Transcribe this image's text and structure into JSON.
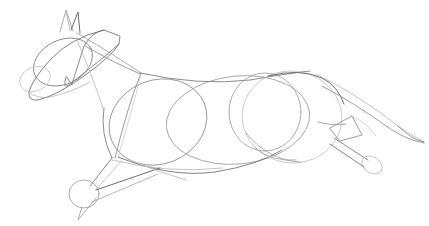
{
  "artwork": {
    "title": "Horse construction sketch",
    "subject": "galloping horse",
    "medium": "graphite pencil on white paper",
    "style": "gesture / construction under-drawing",
    "orientation": "facing left",
    "background_color": "#ffffff",
    "canvas": {
      "width": 429,
      "height": 226
    }
  },
  "palette": {
    "paper": "#ffffff",
    "graphite_dark": "#6b6b73",
    "graphite_mid": "#8a8a92",
    "graphite_light": "#a9a9b1",
    "graphite_faint": "#c2c2c8"
  },
  "line_weights": {
    "primary": 1.0,
    "secondary": 0.85,
    "faint": 0.7
  },
  "shapes": {
    "head": {
      "label": "head mass",
      "type": "tilted-quadrilateral-oval",
      "path": "M 72 84 L 84 46 Q 92 32 104 30 L 120 36 L 119 44 L 104 57 L 70 84 Q 62 91 66 77 Z"
    },
    "head_outline": {
      "label": "head outline sweep",
      "path": "M 104 30 Q 70 38 50 60 Q 32 80 29 92 Q 28 101 38 100 Q 56 96 84 76 Q 112 56 119 44"
    },
    "head_lower": {
      "label": "head lower jaw line",
      "path": "M 29 92 Q 36 99 50 97 Q 70 93 90 82"
    },
    "jaw_oval": {
      "label": "cheek / jowl circle",
      "cx": 63,
      "cy": 62,
      "rx": 31,
      "ry": 22,
      "rotate": -26
    },
    "muzzle_oval": {
      "label": "muzzle circle",
      "cx": 35,
      "cy": 79,
      "rx": 16,
      "ry": 12,
      "rotate": -26
    },
    "ear_left": {
      "label": "left ear triangle",
      "path": "M 60 32 L 66 10 L 73 31"
    },
    "ear_right": {
      "label": "right ear triangle",
      "path": "M 71 30 L 78 12 L 80 33"
    },
    "ear_inner": {
      "label": "ear inner crease",
      "path": "M 66 11 L 70 30"
    },
    "neck_top": {
      "label": "neck top line (crest)",
      "path": "M 77 33 Q 110 52 141 73"
    },
    "neck_front": {
      "label": "neck underside line",
      "path": "M 77 40 Q 90 70 103 108"
    },
    "neck_mid": {
      "label": "neck construction line",
      "path": "M 85 46 Q 112 62 140 74"
    },
    "chest_oval": {
      "label": "shoulder / chest oval",
      "cx": 158,
      "cy": 122,
      "rx": 50,
      "ry": 42,
      "rotate": -22
    },
    "shoulder_blade": {
      "label": "shoulder blade diagonal",
      "path": "M 141 73 Q 128 105 115 158"
    },
    "shoulder_blade2": {
      "label": "scapula second edge",
      "path": "M 141 74 Q 135 100 118 157"
    },
    "back_line": {
      "label": "topline / back curve",
      "path": "M 140 73 Q 200 86 250 80 Q 290 73 310 71"
    },
    "barrel": {
      "label": "barrel / rib cage oval",
      "cx": 238,
      "cy": 120,
      "rx": 72,
      "ry": 44,
      "rotate": -6
    },
    "belly_line": {
      "label": "belly sweep",
      "path": "M 118 157 Q 170 178 215 172 Q 258 165 282 150"
    },
    "belly_line2": {
      "label": "underline second pass",
      "path": "M 112 160 Q 168 174 222 168"
    },
    "hind_oval": {
      "label": "hindquarter large oval",
      "cx": 292,
      "cy": 117,
      "rx": 50,
      "ry": 46,
      "rotate": 7
    },
    "hip_circle": {
      "label": "hip / stifle circle",
      "cx": 265,
      "cy": 112,
      "rx": 36,
      "ry": 39,
      "rotate": 0
    },
    "rump_curve": {
      "label": "croup / rump curve",
      "path": "M 268 76 Q 300 68 322 78 Q 338 86 344 104"
    },
    "tail": {
      "label": "tail sweep",
      "path": "M 316 74 Q 360 96 398 126 Q 412 136 424 142"
    },
    "tail2": {
      "label": "tail lower edge",
      "path": "M 322 86 Q 356 104 392 130 Q 408 140 424 143"
    },
    "tail_tip": {
      "label": "tail tapered tip",
      "path": "M 398 126 Q 412 140 424 142"
    },
    "hind_leg_upper": {
      "label": "hind leg upper (gaskin) line",
      "path": "M 318 122 Q 332 126 346 124"
    },
    "hock_diamond": {
      "label": "hock joint construction quad",
      "path": "M 330 128 L 352 116 L 362 135 L 340 141 Z"
    },
    "hock_brace": {
      "label": "hock brace line",
      "path": "M 352 116 Q 368 124 376 136"
    },
    "hind_cannon": {
      "label": "hind cannon bone",
      "path": "M 334 138 L 368 160"
    },
    "hind_cannon2": {
      "label": "hind cannon bone second edge",
      "path": "M 330 144 L 364 167"
    },
    "hind_hoof": {
      "label": "hind hoof capsule",
      "cx": 372,
      "cy": 165,
      "rx": 11,
      "ry": 8,
      "rotate": 32
    },
    "fore_leg_upper": {
      "label": "foreleg upper line from chest",
      "path": "M 112 158 L 90 186"
    },
    "fore_leg_upper2": {
      "label": "foreleg forearm second edge",
      "path": "M 122 160 L 96 190"
    },
    "knee_circle": {
      "label": "knee joint circle",
      "cx": 84,
      "cy": 194,
      "rx": 15,
      "ry": 14,
      "rotate": 0
    },
    "fore_cannon": {
      "label": "folded foreleg cannon",
      "path": "M 96 190 L 160 168"
    },
    "fore_cannon2": {
      "label": "folded foreleg cannon second edge",
      "path": "M 92 202 L 158 174"
    },
    "fore_hoof": {
      "label": "front hoof point",
      "path": "M 82 207 L 78 220 L 96 198"
    },
    "far_foreleg": {
      "label": "far foreleg guide line",
      "path": "M 130 160 Q 158 172 186 180"
    },
    "chest_front": {
      "label": "chest front curve",
      "path": "M 104 108 Q 100 134 112 158"
    },
    "flank_line": {
      "label": "flank connecting curve",
      "path": "M 255 148 Q 272 162 296 160"
    },
    "stifle_curve": {
      "label": "stifle lower curve",
      "path": "M 246 133 Q 268 160 300 162"
    }
  }
}
